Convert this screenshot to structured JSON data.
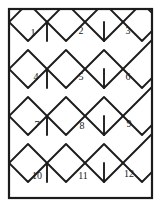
{
  "figure": {
    "background_color": "#ffffff",
    "line_color": "#1c1c1c",
    "label_color": "#1a1a1a"
  },
  "frame": {
    "name": "outer-border",
    "x": 9,
    "y": 9,
    "width": 143,
    "height": 189,
    "stroke_width": 2.2
  },
  "tiles": [
    {
      "number": "1",
      "label_x": 33,
      "label_y": 34,
      "row": 1,
      "column": 1
    },
    {
      "number": "2",
      "label_x": 81,
      "label_y": 32,
      "row": 1,
      "column": 2
    },
    {
      "number": "3",
      "label_x": 128,
      "label_y": 32,
      "row": 1,
      "column": 3
    },
    {
      "number": "4",
      "label_x": 36,
      "label_y": 78,
      "row": 2,
      "column": 1
    },
    {
      "number": "5",
      "label_x": 81,
      "label_y": 78,
      "row": 2,
      "column": 2
    },
    {
      "number": "6",
      "label_x": 128,
      "label_y": 78,
      "row": 2,
      "column": 3
    },
    {
      "number": "7",
      "label_x": 37,
      "label_y": 126,
      "row": 3,
      "column": 1
    },
    {
      "number": "8",
      "label_x": 82,
      "label_y": 127,
      "row": 3,
      "column": 2
    },
    {
      "number": "9",
      "label_x": 129,
      "label_y": 125,
      "row": 3,
      "column": 3
    },
    {
      "number": "10",
      "label_x": 37,
      "label_y": 177,
      "row": 4,
      "column": 1
    },
    {
      "number": "11",
      "label_x": 83,
      "label_y": 177,
      "row": 4,
      "column": 2
    },
    {
      "number": "12",
      "label_x": 129,
      "label_y": 175,
      "row": 4,
      "column": 3
    }
  ],
  "geometry": {
    "zigzag_rows": [
      {
        "name": "row-0-zigzag",
        "points": "9,22 28,3 47,22 66,3 85,22 104,3 123,22 142,3 161,22"
      },
      {
        "name": "row-1-zigzag",
        "points": "-9,40 9,22 28,41 47,22 66,41 85,22 104,41 123,22 142,41 152,31"
      },
      {
        "name": "row-2-zigzag",
        "points": "9,69 28,88 47,69 66,88 85,69 104,88 123,69 142,88 152,78"
      },
      {
        "name": "row-3-zigzag",
        "points": "-9,88 9,69 28,50 47,69 66,50 85,69 104,50 123,69 142,50 152,40"
      },
      {
        "name": "row-4-zigzag",
        "points": "9,116 28,135 47,116 66,135 85,116 104,135 123,116 142,135 152,125"
      },
      {
        "name": "row-5-zigzag",
        "points": "-9,135 9,116 28,97 47,116 66,97 85,116 104,97 123,116 142,97 152,87"
      },
      {
        "name": "row-6-zigzag",
        "points": "9,163 28,182 47,163 66,182 85,163 104,182 123,163 142,182 152,172"
      },
      {
        "name": "row-7-zigzag",
        "points": "-9,182 9,163 28,144 47,163 66,144 85,163 104,144 123,163 142,144 152,134"
      },
      {
        "name": "row-8-zigzag",
        "points": "-9,210 9,198 28,217 47,198 66,217 85,198 104,217 123,198 142,217"
      }
    ],
    "connectors": [
      {
        "name": "connector-r1-c1",
        "x1": 47,
        "y1": 22,
        "x2": 47,
        "y2": 41
      },
      {
        "name": "connector-r1-c2",
        "x1": 104,
        "y1": 22,
        "x2": 104,
        "y2": 41
      },
      {
        "name": "connector-r2-c1",
        "x1": 47,
        "y1": 69,
        "x2": 47,
        "y2": 88
      },
      {
        "name": "connector-r2-c2",
        "x1": 104,
        "y1": 69,
        "x2": 104,
        "y2": 88
      },
      {
        "name": "connector-r3-c1",
        "x1": 47,
        "y1": 116,
        "x2": 47,
        "y2": 135
      },
      {
        "name": "connector-r3-c2",
        "x1": 104,
        "y1": 116,
        "x2": 104,
        "y2": 135
      },
      {
        "name": "connector-r4-c1",
        "x1": 47,
        "y1": 163,
        "x2": 47,
        "y2": 182
      },
      {
        "name": "connector-r4-c2",
        "x1": 104,
        "y1": 163,
        "x2": 104,
        "y2": 182
      }
    ]
  }
}
